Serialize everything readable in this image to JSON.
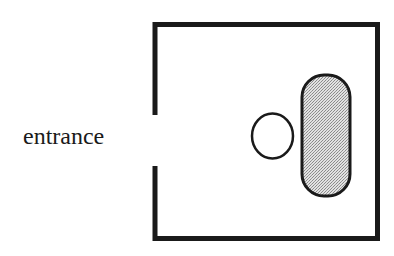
{
  "diagram": {
    "entrance_label": "entrance",
    "colors": {
      "stroke": "#1a1a1a",
      "fill_shaded": "#c8c8c8",
      "background": "#ffffff"
    },
    "elements": [
      {
        "name": "room-walls",
        "type": "rect-with-gap",
        "gap_side": "left"
      },
      {
        "name": "circle-object",
        "type": "ellipse",
        "fill": "none"
      },
      {
        "name": "shaded-capsule",
        "type": "rounded-rect",
        "fill": "shaded"
      }
    ]
  }
}
